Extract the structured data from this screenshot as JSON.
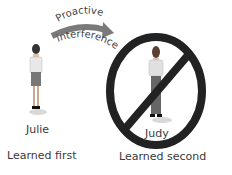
{
  "arrow": {
    "label_top": "Proactive",
    "label_bottom": "interference",
    "color": "#777777"
  },
  "left_person": {
    "name": "Julie",
    "caption": "Learned first"
  },
  "right_person": {
    "name": "Judy",
    "caption": "Learned second"
  },
  "prohibition_sign": {
    "color": "#222222"
  }
}
